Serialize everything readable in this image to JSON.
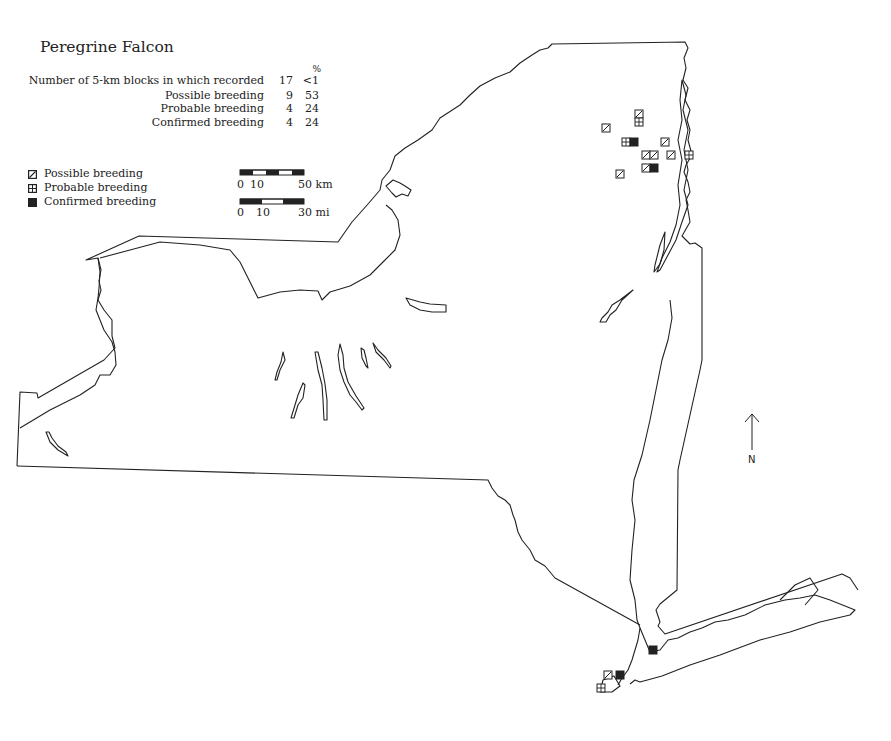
{
  "title": "Peregrine Falcon",
  "stats": {
    "percent_header": "%",
    "rows": [
      {
        "label": "Number of 5-km blocks in which recorded",
        "count": "17",
        "percent": "<1"
      },
      {
        "label": "Possible breeding",
        "count": "9",
        "percent": "53"
      },
      {
        "label": "Probable breeding",
        "count": "4",
        "percent": "24"
      },
      {
        "label": "Confirmed breeding",
        "count": "4",
        "percent": "24"
      }
    ]
  },
  "legend": {
    "items": [
      {
        "symbol": "possible-breeding-icon",
        "label": "Possible breeding"
      },
      {
        "symbol": "probable-breeding-icon",
        "label": "Probable breeding"
      },
      {
        "symbol": "confirmed-breeding-icon",
        "label": "Confirmed breeding"
      }
    ]
  },
  "scale_bars": {
    "km": {
      "start": "0",
      "mid": "10",
      "end": "50 km"
    },
    "mi": {
      "start": "0",
      "mid": "10",
      "end": "30 mi"
    }
  },
  "north_arrow": {
    "label": "N"
  },
  "records": [
    {
      "type": "possible",
      "x": 639,
      "y": 114
    },
    {
      "type": "probable",
      "x": 639,
      "y": 122
    },
    {
      "type": "possible",
      "x": 606,
      "y": 128
    },
    {
      "type": "probable",
      "x": 626,
      "y": 142
    },
    {
      "type": "confirmed",
      "x": 634,
      "y": 142
    },
    {
      "type": "possible",
      "x": 665,
      "y": 142
    },
    {
      "type": "possible",
      "x": 646,
      "y": 155
    },
    {
      "type": "possible",
      "x": 654,
      "y": 155
    },
    {
      "type": "possible",
      "x": 671,
      "y": 155
    },
    {
      "type": "probable",
      "x": 689,
      "y": 155
    },
    {
      "type": "possible",
      "x": 646,
      "y": 168
    },
    {
      "type": "confirmed",
      "x": 654,
      "y": 168
    },
    {
      "type": "possible",
      "x": 620,
      "y": 174
    },
    {
      "type": "confirmed",
      "x": 653,
      "y": 650
    },
    {
      "type": "possible",
      "x": 608,
      "y": 675
    },
    {
      "type": "confirmed",
      "x": 620,
      "y": 675
    },
    {
      "type": "probable",
      "x": 601,
      "y": 688
    }
  ],
  "colors": {
    "ink": "#222222",
    "background": "#ffffff"
  }
}
